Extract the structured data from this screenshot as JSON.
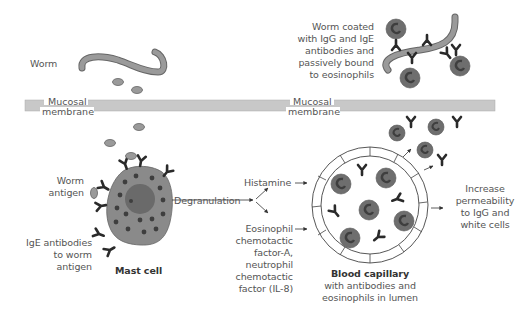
{
  "diagram": {
    "labels": {
      "worm": "Worm",
      "membrane_left_line1": "Mucosal",
      "membrane_left_line2": "membrane",
      "membrane_right_line1": "Mucosal",
      "membrane_right_line2": "membrane",
      "coated_worm": [
        "Worm coated",
        "with IgG and IgE",
        "antibodies and",
        "passively bound",
        "to eosinophils"
      ],
      "worm_antigen": [
        "Worm",
        "antigen"
      ],
      "ige_antibodies": [
        "IgE antibodies",
        "to worm",
        "antigen"
      ],
      "mast_cell": "Mast cell",
      "degranulation": "Degranulation",
      "histamine": "Histamine",
      "chemotactic": [
        "Eosinophil",
        "chemotactic",
        "factor-A,",
        "neutrophil",
        "chemotactic",
        "factor (IL-8)"
      ],
      "capillary_title": "Blood capillary",
      "capillary_sub": [
        "with antibodies and",
        "eosinophils in lumen"
      ],
      "permeability": [
        "Increase",
        "permeability",
        "to IgG and",
        "white cells"
      ]
    },
    "colors": {
      "membrane": "#c8c8c8",
      "worm": "#9a9a9a",
      "mast_cell": "#8a8a8a",
      "granule": "#404040",
      "eosinophil": "#6e6e6e",
      "antibody": "#2a2a2a",
      "text": "#555555"
    }
  }
}
